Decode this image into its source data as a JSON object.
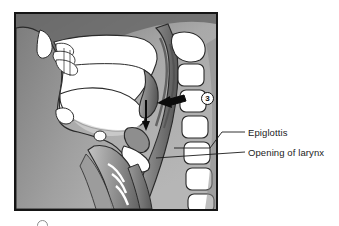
{
  "figure": {
    "title_alt": "Sagittal section of head and neck showing swallowing stage",
    "frame": {
      "x": 14,
      "y": 12,
      "width": 204,
      "height": 199,
      "border_color": "#151515",
      "background_color": "#b4b4b4"
    },
    "marker": {
      "number": "3",
      "shape": "circle"
    },
    "colors": {
      "background_light": "#b4b4b4",
      "background_dark": "#6f6f6f",
      "tissue_fill": "#ffffff",
      "muscle_mid": "#8d8d8d",
      "muscle_dark": "#5d5d5d",
      "outline": "#1b1b1b",
      "arrow_black": "#0b0b0b"
    },
    "structures": [
      "nasal cavity",
      "nasal conchae",
      "hard palate",
      "soft palate",
      "oral cavity",
      "tongue",
      "mandible",
      "hyoid bone",
      "epiglottis",
      "larynx",
      "trachea",
      "esophagus",
      "pharynx",
      "cervical vertebrae",
      "spinal cord"
    ],
    "arrows": [
      {
        "name": "bolus-descent-arrow",
        "direction": "down",
        "color": "#0b0b0b"
      },
      {
        "name": "pharynx-push-arrow",
        "direction": "left",
        "color": "#0b0b0b"
      }
    ]
  },
  "labels": {
    "epiglottis": "Epiglottis",
    "larynx_opening": "Opening of larynx"
  },
  "leaders": [
    {
      "name": "leader-epiglottis",
      "from_x": 174,
      "from_y": 148,
      "to_x": 245,
      "to_y": 132
    },
    {
      "name": "leader-larynx-opening",
      "from_x": 156,
      "from_y": 158,
      "to_x": 245,
      "to_y": 152
    }
  ]
}
